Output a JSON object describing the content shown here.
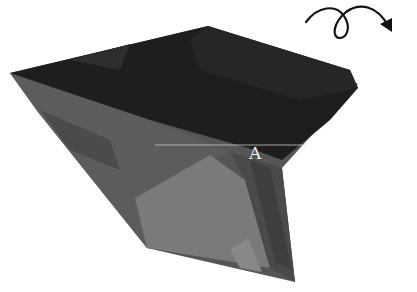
{
  "diagram": {
    "point_label": "A",
    "rotation_indicator": "looped-arrow-rotate-icon",
    "colors": {
      "top_face": "#1c1c1c",
      "side_face": "#5a5a5a",
      "lower_face": "#7a7a7a",
      "reference_line": "#c8c8c8",
      "arrow": "#111111"
    }
  }
}
